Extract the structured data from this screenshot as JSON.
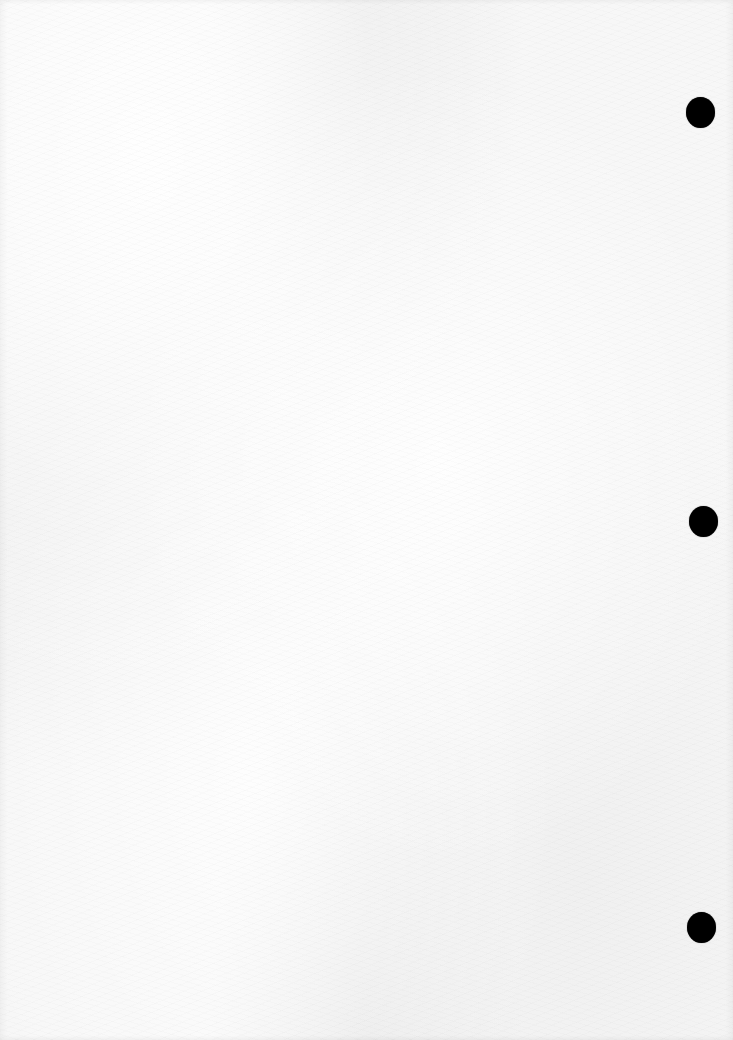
{
  "document": {
    "type": "scanned-blank-page",
    "text_content": "",
    "page_color": "#f7f7f7",
    "hole_color": "#000000"
  },
  "punch_holes": [
    {
      "label": "punch hole top",
      "cx": 700,
      "cy": 112
    },
    {
      "label": "punch hole middle",
      "cx": 703,
      "cy": 521
    },
    {
      "label": "punch hole bottom",
      "cx": 701,
      "cy": 927
    }
  ]
}
